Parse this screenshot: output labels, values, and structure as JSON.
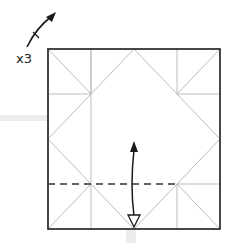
{
  "diagram": {
    "type": "origami-fold-step",
    "repeat_label": "x3",
    "rotate_indicator": "rotate-clockwise",
    "fold_line": "valley-fold-dashed",
    "fold_direction": "fold-up-and-unfold",
    "colors": {
      "outline": "#333333",
      "crease": "#bdbdbd",
      "dash": "#333333",
      "arrow": "#1a1a1a",
      "band": "#ececec"
    }
  }
}
